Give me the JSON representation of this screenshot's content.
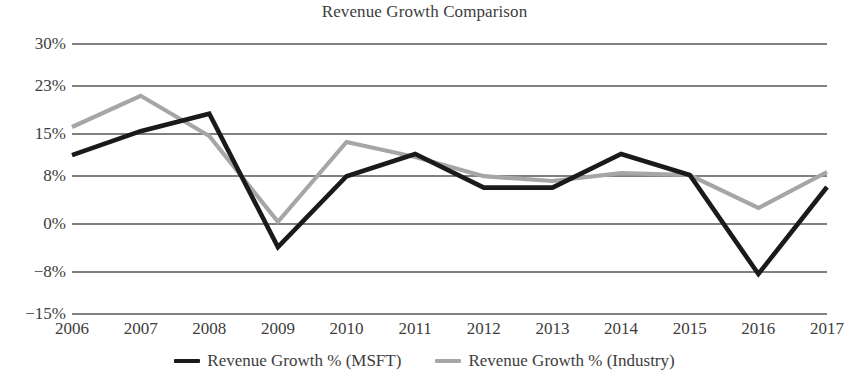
{
  "chart_data": {
    "type": "line",
    "title": "Revenue Growth Comparison",
    "xlabel": "",
    "ylabel": "",
    "grid": true,
    "legend_position": "bottom",
    "x": [
      "2006",
      "2007",
      "2008",
      "2009",
      "2010",
      "2011",
      "2012",
      "2013",
      "2014",
      "2015",
      "2016",
      "2017"
    ],
    "categories": [
      "2006",
      "2007",
      "2008",
      "2009",
      "2010",
      "2011",
      "2012",
      "2013",
      "2014",
      "2015",
      "2016",
      "2017"
    ],
    "ylim": [
      -15,
      30
    ],
    "ytick_values": [
      30,
      23,
      15,
      8,
      0,
      -8,
      -15
    ],
    "ytick_labels": [
      "30%",
      "23%",
      "15%",
      "8%",
      "0%",
      "−8%",
      "−15%"
    ],
    "series": [
      {
        "name": "Revenue Growth % (MSFT)",
        "color": "#1a1a1a",
        "values": [
          11.3,
          15.3,
          18.2,
          -4.0,
          7.8,
          11.5,
          5.9,
          5.9,
          11.5,
          8.0,
          -8.5,
          6.0
        ]
      },
      {
        "name": "Revenue Growth % (Industry)",
        "color": "#a6a6a6",
        "values": [
          16.0,
          21.2,
          14.5,
          0.2,
          13.5,
          11.0,
          7.8,
          7.0,
          8.3,
          8.0,
          2.5,
          8.5
        ]
      }
    ]
  },
  "legend": {
    "items": [
      {
        "label": "Revenue Growth % (MSFT)",
        "color": "#1a1a1a"
      },
      {
        "label": "Revenue Growth % (Industry)",
        "color": "#a6a6a6"
      }
    ]
  },
  "colors": {
    "msft_line": "#1a1a1a",
    "industry_line": "#a6a6a6",
    "gridline": "#808080",
    "text": "#3d3d3d",
    "background": "#ffffff"
  }
}
